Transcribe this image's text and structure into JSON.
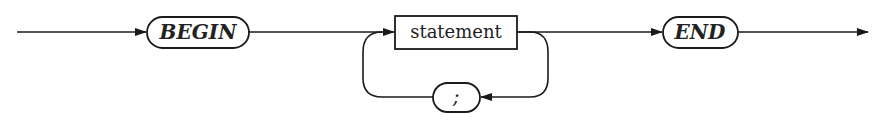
{
  "diagram": {
    "type": "syntax-diagram",
    "nodes": [
      {
        "id": "begin",
        "kind": "terminal",
        "label": "BEGIN"
      },
      {
        "id": "statement",
        "kind": "nonterminal",
        "label": "statement"
      },
      {
        "id": "semicolon",
        "kind": "terminal",
        "label": ";"
      },
      {
        "id": "end",
        "kind": "terminal",
        "label": "END"
      }
    ],
    "edges": [
      {
        "from": "entry",
        "to": "begin"
      },
      {
        "from": "begin",
        "to": "statement"
      },
      {
        "from": "statement",
        "to": "end"
      },
      {
        "from": "statement",
        "to": "semicolon",
        "note": "loop back"
      },
      {
        "from": "semicolon",
        "to": "statement"
      },
      {
        "from": "end",
        "to": "exit"
      }
    ],
    "colors": {
      "line": "#1a1a1a",
      "background": "#ffffff"
    }
  }
}
